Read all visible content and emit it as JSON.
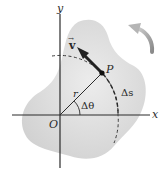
{
  "diagram": {
    "labels": {
      "x_axis": "x",
      "y_axis": "y",
      "origin": "O",
      "point": "P",
      "radius": "r",
      "angle": "Δθ",
      "arc": "Δs",
      "velocity": "v"
    },
    "colors": {
      "body_fill": "#dcdcdc",
      "axis": "#2b2b2b",
      "arrow": "#222222",
      "rotation_arrow": "#9a9a9a",
      "text": "#2a2a2a"
    }
  }
}
